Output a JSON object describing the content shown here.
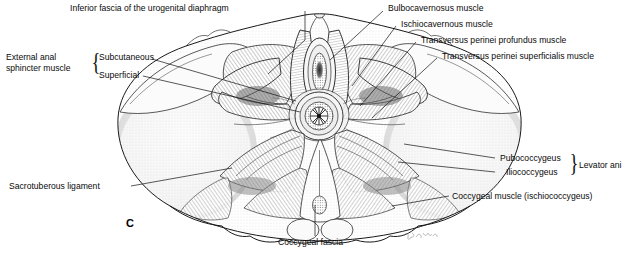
{
  "figure": {
    "panel_letter": "C",
    "signature": "artist-signature",
    "background_color": "#ffffff",
    "ink_color": "#111111"
  },
  "labels": {
    "inferior_fascia": "Inferior fascia of the urogenital diaphragm",
    "external_anal_sphincter": "External anal\nsphincter muscle",
    "external_anal_sphincter_line1": "External anal",
    "external_anal_sphincter_line2": "sphincter muscle",
    "subcutaneous": "Subcutaneous",
    "superficial": "Superficial",
    "bulbocavernosus": "Bulbocavernosus muscle",
    "ischiocavernous": "Ischiocavernous muscle",
    "transversus_profundus": "Transversus perinei profundus muscle",
    "transversus_superficialis": "Transversus perinei superficialis muscle",
    "pubococcygeus": "Pubococcygeus",
    "iliococcygeus": "Iliococcygeus",
    "levator_ani": "Levator ani",
    "coccygeal_muscle": "Coccygeal muscle (ischiococcygeus)",
    "sacrotuberous": "Sacrotuberous ligament",
    "coccygeal_fascia": "Coccygeal fascia"
  },
  "braces": {
    "left_group": "{",
    "right_group": "}"
  }
}
